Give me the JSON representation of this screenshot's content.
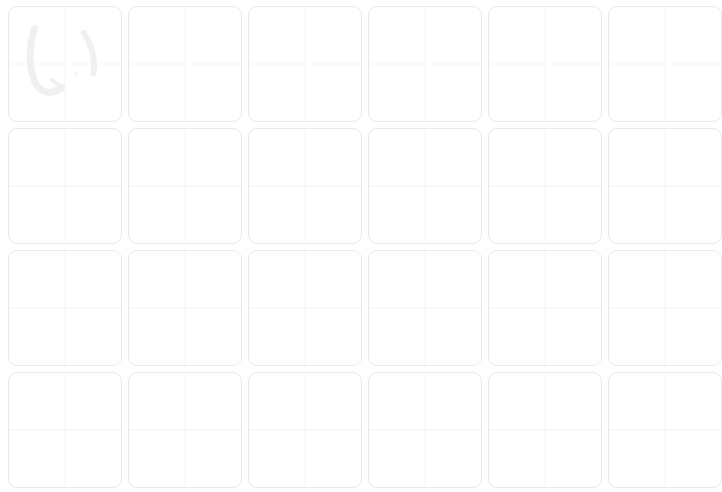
{
  "sheet": {
    "title": "Kana Handwriting Practice Grid",
    "background_color": "#ffffff",
    "columns": 6,
    "rows": 4,
    "cell_width": 114,
    "cell_height": 116,
    "cell_gap": 6,
    "cell_border_color": "#e9e9e9",
    "cell_border_radius": 9,
    "guide_line_color": "#f6f6f6",
    "guide_style": "quadrant-crosshair",
    "glyph_color": "#f0f0f0"
  },
  "cells": [
    {
      "index": 0,
      "row": 1,
      "col": 1,
      "character": "い",
      "romaji": "i",
      "script": "hiragana",
      "filled": true,
      "label": "cell-r1c1"
    },
    {
      "index": 1,
      "row": 1,
      "col": 2,
      "character": "",
      "romaji": "",
      "script": "",
      "filled": false,
      "label": "cell-r1c2"
    },
    {
      "index": 2,
      "row": 1,
      "col": 3,
      "character": "",
      "romaji": "",
      "script": "",
      "filled": false,
      "label": "cell-r1c3"
    },
    {
      "index": 3,
      "row": 1,
      "col": 4,
      "character": "",
      "romaji": "",
      "script": "",
      "filled": false,
      "label": "cell-r1c4"
    },
    {
      "index": 4,
      "row": 1,
      "col": 5,
      "character": "",
      "romaji": "",
      "script": "",
      "filled": false,
      "label": "cell-r1c5"
    },
    {
      "index": 5,
      "row": 1,
      "col": 6,
      "character": "",
      "romaji": "",
      "script": "",
      "filled": false,
      "label": "cell-r1c6"
    },
    {
      "index": 6,
      "row": 2,
      "col": 1,
      "character": "",
      "romaji": "",
      "script": "",
      "filled": false,
      "label": "cell-r2c1"
    },
    {
      "index": 7,
      "row": 2,
      "col": 2,
      "character": "",
      "romaji": "",
      "script": "",
      "filled": false,
      "label": "cell-r2c2"
    },
    {
      "index": 8,
      "row": 2,
      "col": 3,
      "character": "",
      "romaji": "",
      "script": "",
      "filled": false,
      "label": "cell-r2c3"
    },
    {
      "index": 9,
      "row": 2,
      "col": 4,
      "character": "",
      "romaji": "",
      "script": "",
      "filled": false,
      "label": "cell-r2c4"
    },
    {
      "index": 10,
      "row": 2,
      "col": 5,
      "character": "",
      "romaji": "",
      "script": "",
      "filled": false,
      "label": "cell-r2c5"
    },
    {
      "index": 11,
      "row": 2,
      "col": 6,
      "character": "",
      "romaji": "",
      "script": "",
      "filled": false,
      "label": "cell-r2c6"
    },
    {
      "index": 12,
      "row": 3,
      "col": 1,
      "character": "",
      "romaji": "",
      "script": "",
      "filled": false,
      "label": "cell-r3c1"
    },
    {
      "index": 13,
      "row": 3,
      "col": 2,
      "character": "",
      "romaji": "",
      "script": "",
      "filled": false,
      "label": "cell-r3c2"
    },
    {
      "index": 14,
      "row": 3,
      "col": 3,
      "character": "",
      "romaji": "",
      "script": "",
      "filled": false,
      "label": "cell-r3c3"
    },
    {
      "index": 15,
      "row": 3,
      "col": 4,
      "character": "",
      "romaji": "",
      "script": "",
      "filled": false,
      "label": "cell-r3c4"
    },
    {
      "index": 16,
      "row": 3,
      "col": 5,
      "character": "",
      "romaji": "",
      "script": "",
      "filled": false,
      "label": "cell-r3c5"
    },
    {
      "index": 17,
      "row": 3,
      "col": 6,
      "character": "",
      "romaji": "",
      "script": "",
      "filled": false,
      "label": "cell-r3c6"
    },
    {
      "index": 18,
      "row": 4,
      "col": 1,
      "character": "",
      "romaji": "",
      "script": "",
      "filled": false,
      "label": "cell-r4c1"
    },
    {
      "index": 19,
      "row": 4,
      "col": 2,
      "character": "",
      "romaji": "",
      "script": "",
      "filled": false,
      "label": "cell-r4c2"
    },
    {
      "index": 20,
      "row": 4,
      "col": 3,
      "character": "",
      "romaji": "",
      "script": "",
      "filled": false,
      "label": "cell-r4c3"
    },
    {
      "index": 21,
      "row": 4,
      "col": 4,
      "character": "",
      "romaji": "",
      "script": "",
      "filled": false,
      "label": "cell-r4c4"
    },
    {
      "index": 22,
      "row": 4,
      "col": 5,
      "character": "",
      "romaji": "",
      "script": "",
      "filled": false,
      "label": "cell-r4c5"
    },
    {
      "index": 23,
      "row": 4,
      "col": 6,
      "character": "",
      "romaji": "",
      "script": "",
      "filled": false,
      "label": "cell-r4c6"
    }
  ]
}
